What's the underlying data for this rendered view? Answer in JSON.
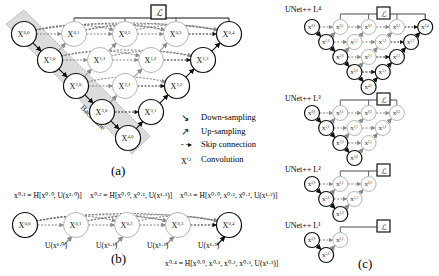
{
  "panel_a": {
    "caption": "(a)",
    "backbone_label": "Backbone",
    "loss_symbol": "ℒ",
    "nodes": [
      {
        "id": "x00",
        "label": "X",
        "sup": "0,0",
        "x": 24,
        "y": 34,
        "active": true
      },
      {
        "id": "x10",
        "label": "X",
        "sup": "1,0",
        "x": 50,
        "y": 60,
        "active": true
      },
      {
        "id": "x20",
        "label": "X",
        "sup": "2,0",
        "x": 76,
        "y": 86,
        "active": true
      },
      {
        "id": "x30",
        "label": "X",
        "sup": "3,0",
        "x": 102,
        "y": 112,
        "active": true
      },
      {
        "id": "x40",
        "label": "X",
        "sup": "4,0",
        "x": 128,
        "y": 138,
        "active": true
      },
      {
        "id": "x01",
        "label": "X",
        "sup": "0,1",
        "x": 74,
        "y": 34,
        "active": false
      },
      {
        "id": "x11",
        "label": "X",
        "sup": "1,1",
        "x": 100,
        "y": 60,
        "active": false
      },
      {
        "id": "x21",
        "label": "X",
        "sup": "2,1",
        "x": 125,
        "y": 86,
        "active": false
      },
      {
        "id": "x31",
        "label": "X",
        "sup": "3,1",
        "x": 151,
        "y": 112,
        "active": true
      },
      {
        "id": "x02",
        "label": "X",
        "sup": "0,2",
        "x": 125,
        "y": 34,
        "active": false
      },
      {
        "id": "x12",
        "label": "X",
        "sup": "1,2",
        "x": 151,
        "y": 60,
        "active": false
      },
      {
        "id": "x22",
        "label": "X",
        "sup": "2,2",
        "x": 177,
        "y": 86,
        "active": true
      },
      {
        "id": "x03",
        "label": "X",
        "sup": "0,3",
        "x": 176,
        "y": 34,
        "active": false
      },
      {
        "id": "x13",
        "label": "X",
        "sup": "1,3",
        "x": 203,
        "y": 60,
        "active": true
      },
      {
        "id": "x04",
        "label": "X",
        "sup": "0,4",
        "x": 229,
        "y": 34,
        "active": true
      }
    ],
    "legend": [
      {
        "icon": "down-arrow",
        "label": "Down-sampling"
      },
      {
        "icon": "up-arrow",
        "label": "Up-sampling"
      },
      {
        "icon": "skip-arrow",
        "label": "Skip connection"
      },
      {
        "icon": "conv-symbol",
        "symbol": "X",
        "sup": "i,j",
        "label": "Convolution"
      }
    ]
  },
  "panel_b": {
    "caption": "(b)",
    "formulas": [
      "x⁰·¹ = H[x⁰·⁰, U(x¹·⁰)]",
      "x⁰·² = H[x⁰·⁰, x⁰·¹, U(x¹·¹)]",
      "x⁰·³ = H[x⁰·⁰, x⁰·¹, x⁰·², U(x¹·²)]",
      "x⁰·⁴ = H[x⁰·⁰, x⁰·¹, x⁰·², x⁰·³, U(x¹·³)]"
    ],
    "nodes": [
      {
        "label": "X",
        "sup": "0,0",
        "x": 25,
        "active": true
      },
      {
        "label": "X",
        "sup": "0,1",
        "x": 76,
        "active": false
      },
      {
        "label": "X",
        "sup": "0,2",
        "x": 127,
        "active": false
      },
      {
        "label": "X",
        "sup": "0,3",
        "x": 178,
        "active": false
      },
      {
        "label": "X",
        "sup": "0,4",
        "x": 229,
        "active": true
      }
    ],
    "upsample_labels": [
      "U(x¹·⁰)",
      "U(x¹·¹)",
      "U(x¹·²)",
      "U(x¹·³)"
    ]
  },
  "panel_c": {
    "caption": "(c)",
    "loss_symbol": "ℒ",
    "subfigures": [
      {
        "title": "UNet++ L⁴",
        "depth": 4
      },
      {
        "title": "UNet++ L³",
        "depth": 3
      },
      {
        "title": "UNet++ L²",
        "depth": 2
      },
      {
        "title": "UNet++ L¹",
        "depth": 1
      }
    ]
  },
  "colors": {
    "active_stroke": "#111111",
    "inactive_stroke": "#b5b5b5",
    "backbone_fill": "#dcdcdc",
    "skip_dash": "#333333"
  }
}
